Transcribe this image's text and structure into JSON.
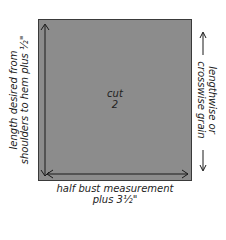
{
  "diagram": {
    "piece": {
      "cut_label": "cut",
      "cut_count": "2",
      "fill_color": "#8c8c8c",
      "border_color": "#3a3a3a"
    },
    "left_dimension": {
      "line1": "length desired from",
      "line2": "shoulders to hem plus ½\""
    },
    "bottom_dimension": {
      "line1": "half bust measurement",
      "line2": "plus 3½\""
    },
    "grain": {
      "line1": "lengthwise or",
      "line2": "crosswise grain",
      "left_arrow": "⟵",
      "right_arrow": "⟶"
    }
  }
}
